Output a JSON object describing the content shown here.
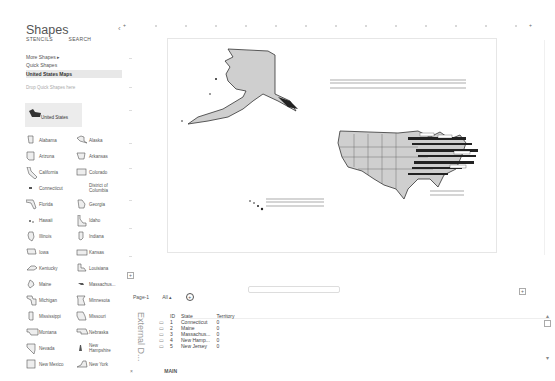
{
  "sidebar": {
    "title": "Shapes",
    "tabs": [
      "STENCILS",
      "SEARCH"
    ],
    "menu": [
      {
        "label": "More Shapes",
        "chevron": "▸"
      },
      {
        "label": "Quick Shapes"
      },
      {
        "label": "United States Maps",
        "active": true
      }
    ],
    "drop_hint": "Drop Quick Shapes here",
    "featured": {
      "label": "United States",
      "icon": "us-map-icon"
    },
    "shapes": [
      {
        "label": "Alabama"
      },
      {
        "label": "Alaska"
      },
      {
        "label": "Arizona"
      },
      {
        "label": "Arkansas"
      },
      {
        "label": "California"
      },
      {
        "label": "Colorado"
      },
      {
        "label": "Connecticut"
      },
      {
        "label": "District of Columbia"
      },
      {
        "label": "Florida"
      },
      {
        "label": "Georgia"
      },
      {
        "label": "Hawaii"
      },
      {
        "label": "Idaho"
      },
      {
        "label": "Illinois"
      },
      {
        "label": "Indiana"
      },
      {
        "label": "Iowa"
      },
      {
        "label": "Kansas"
      },
      {
        "label": "Kentucky"
      },
      {
        "label": "Louisiana"
      },
      {
        "label": "Maine"
      },
      {
        "label": "Massachus..."
      },
      {
        "label": "Michigan"
      },
      {
        "label": "Minnesota"
      },
      {
        "label": "Mississippi"
      },
      {
        "label": "Missouri"
      },
      {
        "label": "Montana"
      },
      {
        "label": "Nebraska"
      },
      {
        "label": "Nevada"
      },
      {
        "label": "New Hampshire"
      },
      {
        "label": "New Mexico"
      },
      {
        "label": "New York"
      }
    ]
  },
  "canvas": {
    "legend_boxes": [
      {
        "title": "State",
        "value_header": "Territory",
        "row_label": "Territory",
        "row_value": "0"
      },
      {
        "title": "State",
        "value_header": "Territory",
        "row_label": "Territory",
        "row_value": "0"
      },
      {
        "title": "State",
        "value_header": "Territory",
        "row_label": "Territory",
        "row_value": "0"
      }
    ]
  },
  "page_tabs": {
    "items": [
      "Page-1",
      "All ▴"
    ],
    "add_icon": "+"
  },
  "external_data": {
    "label": "External D...",
    "columns": [
      "",
      "ID",
      "State",
      "Territory"
    ],
    "rows": [
      {
        "icon": "▭",
        "id": "1",
        "state": "Connecticut",
        "territory": "0"
      },
      {
        "icon": "▭",
        "id": "2",
        "state": "Maine",
        "territory": "0"
      },
      {
        "icon": "▭",
        "id": "3",
        "state": "Massachus...",
        "territory": "0"
      },
      {
        "icon": "▭",
        "id": "4",
        "state": "New Hamp...",
        "territory": "0"
      },
      {
        "icon": "▭",
        "id": "5",
        "state": "New Jersey",
        "territory": "0"
      }
    ],
    "nav_sheet": "MAIN",
    "close_icon": "×"
  }
}
